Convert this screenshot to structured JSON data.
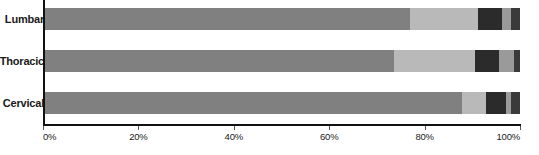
{
  "chart_data": {
    "type": "bar",
    "orientation": "horizontal",
    "stacked": true,
    "normalized": "percent",
    "title": "",
    "subtitle": "",
    "xlabel": "",
    "ylabel": "",
    "xlim": [
      0,
      100
    ],
    "xticks": [
      0,
      20,
      40,
      60,
      80,
      100
    ],
    "xticklabels": [
      "0%",
      "20%",
      "40%",
      "60%",
      "80%",
      "100%"
    ],
    "grid": false,
    "legend": null,
    "categories": [
      "Lumbar",
      "Thoracic",
      "Cervical"
    ],
    "series": [
      {
        "name": "series-1",
        "color": "#808080",
        "values": [
          77.0,
          73.6,
          87.8
        ]
      },
      {
        "name": "series-2",
        "color": "#b9b9b9",
        "values": [
          14.3,
          17.0,
          5.0
        ]
      },
      {
        "name": "series-3",
        "color": "#2b2b2b",
        "values": [
          5.0,
          5.0,
          4.2
        ]
      },
      {
        "name": "series-4",
        "color": "#9a9a9a",
        "values": [
          1.9,
          3.2,
          1.1
        ]
      },
      {
        "name": "series-5",
        "color": "#3a3a3a",
        "values": [
          1.8,
          1.2,
          1.9
        ]
      }
    ],
    "bars": [
      {
        "category": "Lumbar",
        "segments": [
          {
            "color": "#808080",
            "percent": 77.0
          },
          {
            "color": "#b9b9b9",
            "percent": 14.3
          },
          {
            "color": "#2b2b2b",
            "percent": 5.0
          },
          {
            "color": "#9a9a9a",
            "percent": 1.9
          },
          {
            "color": "#3a3a3a",
            "percent": 1.8
          }
        ]
      },
      {
        "category": "Thoracic",
        "segments": [
          {
            "color": "#808080",
            "percent": 73.6
          },
          {
            "color": "#b9b9b9",
            "percent": 17.0
          },
          {
            "color": "#2b2b2b",
            "percent": 5.0
          },
          {
            "color": "#9a9a9a",
            "percent": 3.2
          },
          {
            "color": "#3a3a3a",
            "percent": 1.2
          }
        ]
      },
      {
        "category": "Cervical",
        "segments": [
          {
            "color": "#808080",
            "percent": 87.8
          },
          {
            "color": "#b9b9b9",
            "percent": 5.0
          },
          {
            "color": "#2b2b2b",
            "percent": 4.2
          },
          {
            "color": "#9a9a9a",
            "percent": 1.1
          },
          {
            "color": "#3a3a3a",
            "percent": 1.9
          }
        ]
      }
    ]
  },
  "axis": {
    "tick_labels": [
      "0%",
      "20%",
      "40%",
      "60%",
      "80%",
      "100%"
    ],
    "tick_values": [
      0,
      20,
      40,
      60,
      80,
      100
    ]
  },
  "colors": {
    "axis_line": "#111111",
    "tick_mark": "#555555",
    "label_text": "#1a1a1a",
    "background": "#ffffff"
  }
}
